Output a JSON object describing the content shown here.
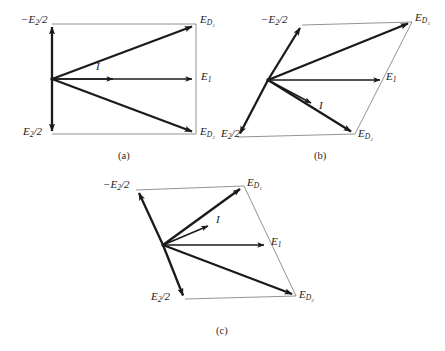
{
  "figure": {
    "background_color": "#ffffff",
    "ink_color": "#1a1a1a",
    "thin_line_color": "#777777"
  },
  "labels": {
    "minus_e2_over_2": "−E",
    "minus_e2_over_2_sub": "2",
    "minus_e2_over_2_tail": "/2",
    "e2_over_2": "E",
    "e2_over_2_sub": "2",
    "e2_over_2_tail": "/2",
    "ed1": "E",
    "ed1_sub": "D₁",
    "ed2": "E",
    "ed2_sub": "D₂",
    "e1": "E",
    "e1_sub": "1",
    "current": "I"
  },
  "captions": {
    "a": "(a)",
    "b": "(b)",
    "c": "(c)"
  },
  "panels": [
    {
      "id": "a",
      "caption": "(a)",
      "description": "Rectangular phasor diagram: E1 horizontal, E2/2 vertical, ED1 and ED2 symmetric",
      "origin": [
        52,
        79
      ],
      "vertices": {
        "top_left": [
          52,
          24
        ],
        "top_right": [
          196,
          24
        ],
        "bottom_left": [
          52,
          134
        ],
        "bottom_right": [
          196,
          134
        ],
        "e1_tip": [
          196,
          79
        ]
      },
      "vectors": [
        {
          "name": "minus-e2-over-2",
          "from": [
            52,
            79
          ],
          "to": [
            52,
            24
          ],
          "weight": "heavy"
        },
        {
          "name": "e2-over-2",
          "from": [
            52,
            79
          ],
          "to": [
            52,
            134
          ],
          "weight": "heavy"
        },
        {
          "name": "ed1",
          "from": [
            52,
            79
          ],
          "to": [
            196,
            24
          ],
          "weight": "heavy"
        },
        {
          "name": "ed2",
          "from": [
            52,
            79
          ],
          "to": [
            196,
            134
          ],
          "weight": "heavy"
        },
        {
          "name": "e1",
          "from": [
            52,
            79
          ],
          "to": [
            196,
            79
          ],
          "weight": "light"
        },
        {
          "name": "current",
          "from": [
            52,
            79
          ],
          "to": [
            116,
            79
          ],
          "weight": "light"
        }
      ],
      "guides": [
        {
          "from": [
            52,
            24
          ],
          "to": [
            196,
            24
          ]
        },
        {
          "from": [
            52,
            134
          ],
          "to": [
            196,
            134
          ]
        },
        {
          "from": [
            196,
            24
          ],
          "to": [
            196,
            134
          ]
        }
      ],
      "label_positions": {
        "minus_e2_over_2": [
          21,
          18
        ],
        "e2_over_2": [
          23,
          128
        ],
        "ed1": [
          200,
          17
        ],
        "ed2": [
          200,
          127
        ],
        "e1": [
          201,
          72
        ],
        "current": [
          96,
          64
        ]
      }
    },
    {
      "id": "b",
      "caption": "(b)",
      "description": "Sheared parallelogram: E2/2 axis tilted, I rotated below E1",
      "origin": [
        268,
        80
      ],
      "vertices": {
        "top_left": [
          302,
          25
        ],
        "top_right": [
          412,
          22
        ],
        "bottom_left": [
          238,
          137
        ],
        "bottom_right": [
          355,
          134
        ],
        "e1_tip": [
          384,
          80
        ]
      },
      "vectors": [
        {
          "name": "minus-e2-over-2",
          "from": [
            268,
            80
          ],
          "to": [
            302,
            25
          ],
          "weight": "heavy"
        },
        {
          "name": "e2-over-2",
          "from": [
            268,
            80
          ],
          "to": [
            238,
            137
          ],
          "weight": "heavy"
        },
        {
          "name": "ed1",
          "from": [
            268,
            80
          ],
          "to": [
            412,
            22
          ],
          "weight": "heavy"
        },
        {
          "name": "ed2",
          "from": [
            268,
            80
          ],
          "to": [
            355,
            134
          ],
          "weight": "heavy"
        },
        {
          "name": "e1",
          "from": [
            268,
            80
          ],
          "to": [
            384,
            80
          ],
          "weight": "light"
        },
        {
          "name": "current",
          "from": [
            268,
            80
          ],
          "to": [
            315,
            105
          ],
          "weight": "light"
        }
      ],
      "guides": [
        {
          "from": [
            302,
            25
          ],
          "to": [
            412,
            22
          ]
        },
        {
          "from": [
            238,
            137
          ],
          "to": [
            355,
            134
          ]
        },
        {
          "from": [
            412,
            22
          ],
          "to": [
            355,
            134
          ]
        }
      ],
      "label_positions": {
        "minus_e2_over_2": [
          262,
          18
        ],
        "e2_over_2": [
          222,
          131
        ],
        "ed1": [
          416,
          16
        ],
        "ed2": [
          359,
          130
        ],
        "e1": [
          387,
          73
        ],
        "current": [
          320,
          104
        ]
      }
    },
    {
      "id": "c",
      "caption": "(c)",
      "description": "Further sheared parallelogram: ED2 nearly horizontal, I above E1",
      "origin": [
        163,
        245
      ],
      "vertices": {
        "top_left": [
          136,
          190
        ],
        "top_right": [
          244,
          186
        ],
        "bottom_left": [
          185,
          299
        ],
        "bottom_right": [
          296,
          296
        ],
        "e1_tip": [
          268,
          245
        ]
      },
      "vectors": [
        {
          "name": "minus-e2-over-2",
          "from": [
            163,
            245
          ],
          "to": [
            136,
            190
          ],
          "weight": "heavy"
        },
        {
          "name": "e2-over-2",
          "from": [
            163,
            245
          ],
          "to": [
            185,
            299
          ],
          "weight": "heavy"
        },
        {
          "name": "ed1",
          "from": [
            163,
            245
          ],
          "to": [
            244,
            186
          ],
          "weight": "heavy"
        },
        {
          "name": "ed2",
          "from": [
            163,
            245
          ],
          "to": [
            296,
            296
          ],
          "weight": "heavy"
        },
        {
          "name": "e1",
          "from": [
            163,
            245
          ],
          "to": [
            268,
            245
          ],
          "weight": "light"
        },
        {
          "name": "current",
          "from": [
            163,
            245
          ],
          "to": [
            212,
            224
          ],
          "weight": "light"
        }
      ],
      "guides": [
        {
          "from": [
            136,
            190
          ],
          "to": [
            244,
            186
          ]
        },
        {
          "from": [
            185,
            299
          ],
          "to": [
            296,
            296
          ]
        },
        {
          "from": [
            244,
            186
          ],
          "to": [
            296,
            296
          ]
        }
      ],
      "label_positions": {
        "minus_e2_over_2": [
          104,
          183
        ],
        "e2_over_2": [
          152,
          294
        ],
        "ed1": [
          248,
          180
        ],
        "ed2": [
          300,
          292
        ],
        "e1": [
          272,
          238
        ],
        "current": [
          217,
          218
        ]
      }
    }
  ],
  "caption_positions": {
    "a": [
      118,
      152
    ],
    "b": [
      314,
      152
    ],
    "c": [
      216,
      327
    ]
  }
}
